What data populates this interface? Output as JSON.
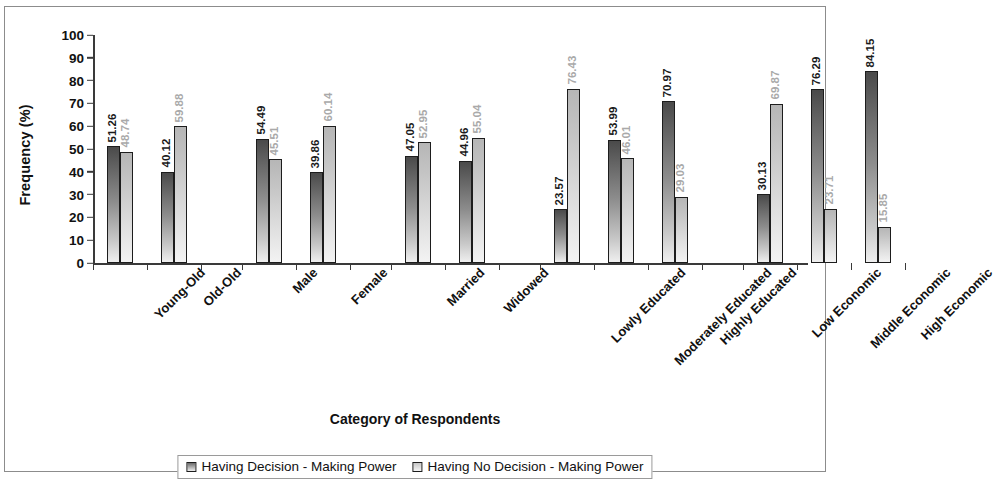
{
  "chart_data": {
    "type": "bar",
    "title": "",
    "xlabel": "Category of Respondents",
    "ylabel": "Frequency (%)",
    "ylim": [
      0,
      100
    ],
    "yticks": [
      100,
      90,
      80,
      70,
      60,
      50,
      40,
      30,
      20,
      10,
      0
    ],
    "grid": false,
    "legend_position": "bottom",
    "categories": [
      "Young-Old",
      "Old-Old",
      "Male",
      "Female",
      "Married",
      "Widowed",
      "Lowly Educated",
      "Moderately Educated",
      "Highly Educated",
      "Low Economic",
      "Middle Economic",
      "High Economic"
    ],
    "groups": [
      {
        "name": "Age",
        "categories": [
          "Young-Old",
          "Old-Old"
        ]
      },
      {
        "name": "Sex",
        "categories": [
          "Male",
          "Female"
        ]
      },
      {
        "name": "Marital Status",
        "categories": [
          "Married",
          "Widowed"
        ]
      },
      {
        "name": "Education",
        "categories": [
          "Lowly Educated",
          "Moderately Educated",
          "Highly Educated"
        ]
      },
      {
        "name": "Economic Status",
        "categories": [
          "Low Economic",
          "Middle Economic",
          "High Economic"
        ]
      }
    ],
    "series": [
      {
        "name": "Having Decision - Making Power",
        "values": [
          51.26,
          40.12,
          54.49,
          39.86,
          47.05,
          44.96,
          23.57,
          53.99,
          70.97,
          30.13,
          76.29,
          84.15
        ]
      },
      {
        "name": "Having No Decision - Making Power",
        "values": [
          48.74,
          59.88,
          45.51,
          60.14,
          52.95,
          55.04,
          76.43,
          46.01,
          29.03,
          69.87,
          23.71,
          15.85
        ]
      }
    ],
    "data_labels": [
      [
        "51.26",
        "40.12",
        "54.49",
        "39.86",
        "47.05",
        "44.96",
        "23.57",
        "53.99",
        "70.97",
        "30.13",
        "76.29",
        "84.15"
      ],
      [
        "48.74",
        "59.88",
        "45.51",
        "60.14",
        "52.95",
        "55.04",
        "76.43",
        "46.01",
        "29.03",
        "69.87",
        "23.71",
        "15.85"
      ]
    ]
  },
  "legend": {
    "items": [
      "Having Decision - Making Power",
      "Having No Decision - Making Power"
    ]
  }
}
